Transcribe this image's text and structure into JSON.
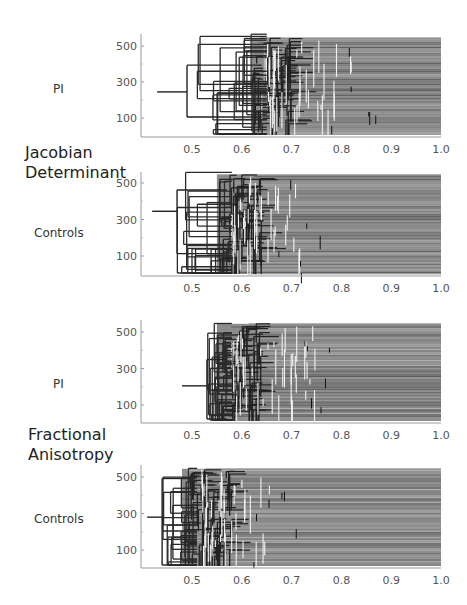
{
  "figure": {
    "groups": [
      {
        "label_line1": "Jacobian",
        "label_line2": "Determinant"
      },
      {
        "label_line1": "Fractional",
        "label_line2": "Anisotropy"
      }
    ],
    "panels": [
      {
        "row_label": "PI",
        "group": "Jacobian Determinant",
        "root_x": 0.43,
        "root_y": 245,
        "first_split": 0.49,
        "dense_start": 0.62,
        "dense_peak": 0.66,
        "light_end": 0.82
      },
      {
        "row_label": "Controls",
        "group": "Jacobian Determinant",
        "root_x": 0.42,
        "root_y": 345,
        "first_split": 0.47,
        "dense_start": 0.55,
        "dense_peak": 0.6,
        "light_end": 0.72
      },
      {
        "row_label": "PI",
        "group": "Fractional Anisotropy",
        "root_x": 0.48,
        "root_y": 205,
        "first_split": 0.53,
        "dense_start": 0.55,
        "dense_peak": 0.6,
        "light_end": 0.75
      },
      {
        "row_label": "Controls",
        "group": "Fractional Anisotropy",
        "root_x": 0.41,
        "root_y": 280,
        "first_split": 0.44,
        "dense_start": 0.48,
        "dense_peak": 0.54,
        "light_end": 0.67
      }
    ]
  },
  "chart_data": [
    {
      "type": "dendrogram",
      "title": "Jacobian Determinant — PI",
      "xlabel": "",
      "ylabel": "",
      "x_ticks": [
        "0.5",
        "0.6",
        "0.7",
        "0.8",
        "0.9",
        "1.0"
      ],
      "y_ticks": [
        "100",
        "300",
        "500"
      ],
      "xlim": [
        0.4,
        1.0
      ],
      "ylim": [
        0,
        550
      ],
      "root_merge_height": 0.43,
      "dense_merging_range": [
        0.6,
        0.85
      ],
      "grid": false
    },
    {
      "type": "dendrogram",
      "title": "Jacobian Determinant — Controls",
      "x_ticks": [
        "0.5",
        "0.6",
        "0.7",
        "0.8",
        "0.9",
        "1.0"
      ],
      "y_ticks": [
        "100",
        "300",
        "500"
      ],
      "xlim": [
        0.4,
        1.0
      ],
      "ylim": [
        0,
        550
      ],
      "root_merge_height": 0.42,
      "dense_merging_range": [
        0.55,
        0.75
      ],
      "grid": false
    },
    {
      "type": "dendrogram",
      "title": "Fractional Anisotropy — PI",
      "x_ticks": [
        "0.5",
        "0.6",
        "0.7",
        "0.8",
        "0.9",
        "1.0"
      ],
      "y_ticks": [
        "100",
        "300",
        "500"
      ],
      "xlim": [
        0.4,
        1.0
      ],
      "ylim": [
        0,
        550
      ],
      "root_merge_height": 0.48,
      "dense_merging_range": [
        0.53,
        0.76
      ],
      "grid": false
    },
    {
      "type": "dendrogram",
      "title": "Fractional Anisotropy — Controls",
      "x_ticks": [
        "0.5",
        "0.6",
        "0.7",
        "0.8",
        "0.9",
        "1.0"
      ],
      "y_ticks": [
        "100",
        "300",
        "500"
      ],
      "xlim": [
        0.4,
        1.0
      ],
      "ylim": [
        0,
        550
      ],
      "root_merge_height": 0.41,
      "dense_merging_range": [
        0.45,
        0.72
      ],
      "grid": false
    }
  ],
  "axes": {
    "x_ticks": [
      "0.5",
      "0.6",
      "0.7",
      "0.8",
      "0.9",
      "1.0"
    ],
    "y_ticks": [
      "500",
      "300",
      "100"
    ]
  }
}
